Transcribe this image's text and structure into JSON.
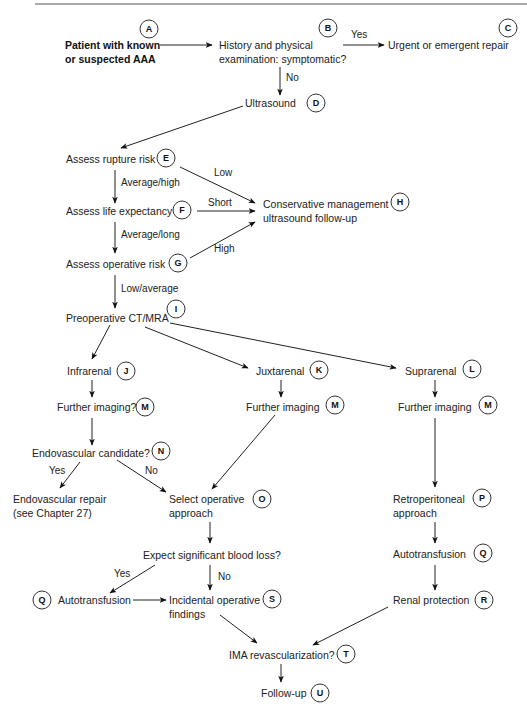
{
  "figure": {
    "nodes": {
      "A": {
        "letter": "A",
        "lines": [
          "Patient with known",
          "or suspected AAA"
        ]
      },
      "B": {
        "letter": "B",
        "lines": [
          "History and physical",
          "examination: symptomatic?"
        ]
      },
      "C": {
        "letter": "C",
        "lines": [
          "Urgent or emergent repair"
        ]
      },
      "D": {
        "letter": "D",
        "lines": [
          "Ultrasound"
        ]
      },
      "E": {
        "letter": "E",
        "lines": [
          "Assess rupture risk"
        ]
      },
      "F": {
        "letter": "F",
        "lines": [
          "Assess life expectancy"
        ]
      },
      "G": {
        "letter": "G",
        "lines": [
          "Assess operative risk"
        ]
      },
      "H": {
        "letter": "H",
        "lines": [
          "Conservative management",
          "ultrasound follow-up"
        ]
      },
      "I": {
        "letter": "I",
        "lines": [
          "Preoperative CT/MRA"
        ]
      },
      "J": {
        "letter": "J",
        "lines": [
          "Infrarenal"
        ]
      },
      "K": {
        "letter": "K",
        "lines": [
          "Juxtarenal"
        ]
      },
      "L": {
        "letter": "L",
        "lines": [
          "Suprarenal"
        ]
      },
      "M1": {
        "letter": "M",
        "lines": [
          "Further imaging?"
        ]
      },
      "M2": {
        "letter": "M",
        "lines": [
          "Further imaging"
        ]
      },
      "M3": {
        "letter": "M",
        "lines": [
          "Further imaging"
        ]
      },
      "N": {
        "letter": "N",
        "lines": [
          "Endovascular candidate?"
        ]
      },
      "EVR": {
        "lines": [
          "Endovascular repair",
          "(see Chapter 27)"
        ]
      },
      "O": {
        "letter": "O",
        "lines": [
          "Select operative",
          "approach"
        ]
      },
      "P": {
        "letter": "P",
        "lines": [
          "Retroperitoneal",
          "approach"
        ]
      },
      "BL": {
        "lines": [
          "Expect significant blood loss?"
        ]
      },
      "Q1": {
        "letter": "Q",
        "lines": [
          "Autotransfusion"
        ]
      },
      "Q2": {
        "letter": "Q",
        "lines": [
          "Autotransfusion"
        ]
      },
      "S": {
        "letter": "S",
        "lines": [
          "Incidental operative",
          "findings"
        ]
      },
      "R": {
        "letter": "R",
        "lines": [
          "Renal protection"
        ]
      },
      "T": {
        "letter": "T",
        "lines": [
          "IMA revascularization?"
        ]
      },
      "U": {
        "letter": "U",
        "lines": [
          "Follow-up"
        ]
      }
    },
    "edge_labels": {
      "b_yes": "Yes",
      "b_no": "No",
      "e_low": "Low",
      "e_avg_high": "Average/high",
      "f_short": "Short",
      "f_avg_long": "Average/long",
      "g_high": "High",
      "g_low_avg": "Low/average",
      "n_yes": "Yes",
      "n_no": "No",
      "bl_yes": "Yes",
      "bl_no": "No"
    },
    "edges": [
      [
        "A",
        "B"
      ],
      [
        "B",
        "C",
        "Yes"
      ],
      [
        "B",
        "D",
        "No"
      ],
      [
        "D",
        "E"
      ],
      [
        "E",
        "H",
        "Low"
      ],
      [
        "E",
        "F",
        "Average/high"
      ],
      [
        "F",
        "H",
        "Short"
      ],
      [
        "F",
        "G",
        "Average/long"
      ],
      [
        "G",
        "H",
        "High"
      ],
      [
        "G",
        "I",
        "Low/average"
      ],
      [
        "I",
        "J"
      ],
      [
        "I",
        "K"
      ],
      [
        "I",
        "L"
      ],
      [
        "J",
        "M1"
      ],
      [
        "M1",
        "N"
      ],
      [
        "N",
        "EVR",
        "Yes"
      ],
      [
        "N",
        "O",
        "No"
      ],
      [
        "K",
        "M2"
      ],
      [
        "M2",
        "O"
      ],
      [
        "L",
        "M3"
      ],
      [
        "M3",
        "P"
      ],
      [
        "P",
        "Q2"
      ],
      [
        "Q2",
        "R"
      ],
      [
        "O",
        "BL"
      ],
      [
        "BL",
        "Q1",
        "Yes"
      ],
      [
        "BL",
        "S",
        "No"
      ],
      [
        "Q1",
        "S"
      ],
      [
        "S",
        "T"
      ],
      [
        "R",
        "T"
      ],
      [
        "T",
        "U"
      ]
    ]
  }
}
